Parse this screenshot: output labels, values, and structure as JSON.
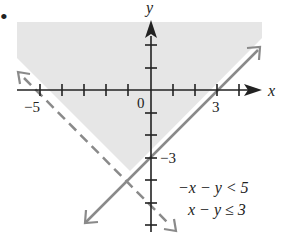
{
  "problem_marker": "•",
  "axes": {
    "x_label": "x",
    "y_label": "y",
    "origin_label": "0",
    "x_tick_labels": [
      {
        "value": -5,
        "text": "−5"
      },
      {
        "value": 3,
        "text": "3"
      }
    ],
    "y_tick_labels": [
      {
        "value": -3,
        "text": "−3"
      }
    ],
    "x_ticks": [
      -5,
      -4,
      -3,
      -2,
      -1,
      1,
      2,
      3,
      4
    ],
    "y_ticks": [
      3,
      2,
      1,
      -1,
      -2,
      -3,
      -4,
      -5,
      -6
    ]
  },
  "inequalities": [
    {
      "text": "−x − y < 5",
      "boundary": "−x − y = 5",
      "style": "dashed"
    },
    {
      "text": "x − y ≤ 3",
      "boundary": "x − y = 3",
      "style": "solid"
    }
  ],
  "colors": {
    "shade": "#e6e6e6",
    "axis": "#222222",
    "boundary": "#8a8a8a"
  }
}
